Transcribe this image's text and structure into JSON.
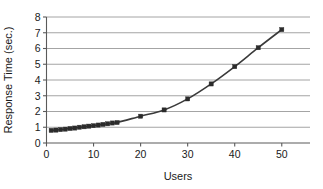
{
  "chart_data": {
    "type": "line",
    "title": "",
    "subtitle": "",
    "xlabel": "Users",
    "ylabel": "Response Time (sec.)",
    "xlim": [
      0,
      56
    ],
    "ylim": [
      0,
      8
    ],
    "xticks": [
      0,
      10,
      20,
      30,
      40,
      50
    ],
    "yticks": [
      0,
      1,
      2,
      3,
      4,
      5,
      6,
      7,
      8
    ],
    "xtick_labels": [
      "0",
      "10",
      "20",
      "30",
      "40",
      "50"
    ],
    "ytick_labels": [
      "0",
      "1",
      "2",
      "3",
      "4",
      "5",
      "6",
      "7",
      "8"
    ],
    "grid": "horizontal",
    "legend": "none",
    "marker": "square",
    "line_color": "#3a3a3a",
    "marker_color": "#2b2b2b",
    "grid_color": "#9a9a9a",
    "axis_color": "#5a5a5a",
    "background_color": "#ffffff",
    "series": [
      {
        "name": "Response Time",
        "x": [
          1,
          2,
          3,
          4,
          5,
          6,
          7,
          8,
          9,
          10,
          11,
          12,
          13,
          14,
          15,
          20,
          25,
          30,
          35,
          40,
          45,
          50
        ],
        "values": [
          0.8,
          0.82,
          0.85,
          0.88,
          0.92,
          0.95,
          1.0,
          1.03,
          1.07,
          1.1,
          1.14,
          1.18,
          1.22,
          1.27,
          1.3,
          1.7,
          2.1,
          2.8,
          3.75,
          4.85,
          6.05,
          7.2
        ]
      }
    ]
  },
  "axes": {
    "x_title": "Users",
    "y_title": "Response Time (sec.)"
  }
}
